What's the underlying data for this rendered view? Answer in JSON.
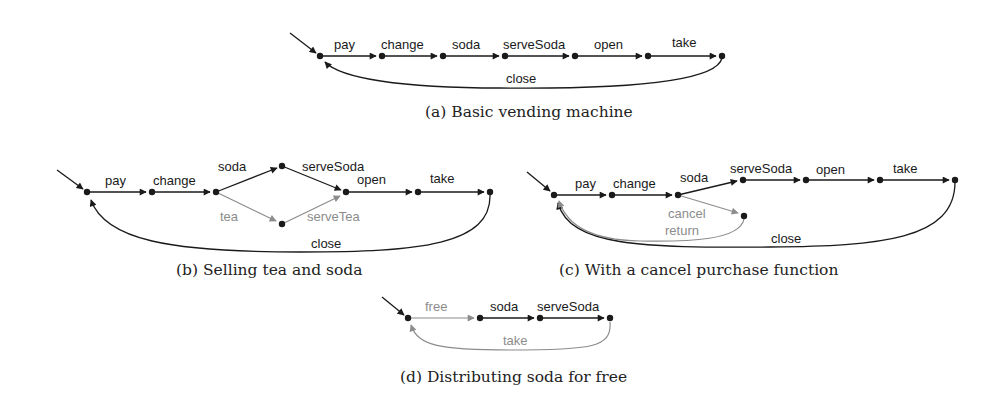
{
  "colors": {
    "black": "#1a1a1a",
    "gray": "#8c8c8c"
  },
  "figures": {
    "a": {
      "caption": "(a) Basic vending machine",
      "nodes": [
        [
          320,
          56
        ],
        [
          382,
          56
        ],
        [
          443,
          56
        ],
        [
          505,
          56
        ],
        [
          575,
          56
        ],
        [
          648,
          56
        ],
        [
          722,
          56
        ]
      ],
      "edges": [
        {
          "label": "pay",
          "lx": 347,
          "ly": 49
        },
        {
          "label": "change",
          "lx": 404,
          "ly": 49
        },
        {
          "label": "soda",
          "lx": 469,
          "ly": 49
        },
        {
          "label": "serveSoda",
          "lx": 532,
          "ly": 49
        },
        {
          "label": "open",
          "lx": 608,
          "ly": 49
        },
        {
          "label": "take",
          "lx": 684,
          "ly": 47
        },
        {
          "label": "close",
          "lx": 520,
          "ly": 86
        }
      ]
    },
    "b": {
      "caption": "(b) Selling tea and soda",
      "nodes": [
        [
          87,
          192
        ],
        [
          152,
          192
        ],
        [
          216,
          192
        ],
        [
          282,
          166
        ],
        [
          346,
          192
        ],
        [
          418,
          192
        ],
        [
          490,
          192
        ],
        [
          282,
          224
        ]
      ],
      "edges": [
        {
          "label": "pay",
          "lx": 118,
          "ly": 185
        },
        {
          "label": "change",
          "lx": 175,
          "ly": 185
        },
        {
          "label": "soda",
          "lx": 234,
          "ly": 171
        },
        {
          "label": "serveSoda",
          "lx": 325,
          "ly": 171
        },
        {
          "label": "open",
          "lx": 381,
          "ly": 184
        },
        {
          "label": "take",
          "lx": 452,
          "ly": 183
        },
        {
          "label": "tea",
          "lx": 229,
          "ly": 221
        },
        {
          "label": "serveTea",
          "lx": 328,
          "ly": 221
        },
        {
          "label": "close",
          "lx": 325,
          "ly": 248
        }
      ]
    },
    "c": {
      "caption": "(c) With a cancel purchase function",
      "nodes": [
        [
          554,
          195
        ],
        [
          612,
          195
        ],
        [
          678,
          195
        ],
        [
          743,
          180
        ],
        [
          806,
          180
        ],
        [
          880,
          180
        ],
        [
          955,
          180
        ],
        [
          744,
          216
        ]
      ],
      "edges": [
        {
          "label": "pay",
          "lx": 589,
          "ly": 187
        },
        {
          "label": "change",
          "lx": 640,
          "ly": 188
        },
        {
          "label": "soda",
          "lx": 696,
          "ly": 182
        },
        {
          "label": "serveSoda",
          "lx": 770,
          "ly": 173
        },
        {
          "label": "open",
          "lx": 830,
          "ly": 174
        },
        {
          "label": "take",
          "lx": 907,
          "ly": 173
        },
        {
          "label": "cancel",
          "lx": 689,
          "ly": 218
        },
        {
          "label": "return",
          "lx": 684,
          "ly": 235
        },
        {
          "label": "close",
          "lx": 786,
          "ly": 243
        }
      ]
    },
    "d": {
      "caption": "(d) Distributing soda for free",
      "nodes": [
        [
          408,
          318
        ],
        [
          480,
          318
        ],
        [
          540,
          318
        ],
        [
          610,
          318
        ]
      ],
      "edges": [
        {
          "label": "free",
          "lx": 440,
          "ly": 311
        },
        {
          "label": "soda",
          "lx": 505,
          "ly": 311
        },
        {
          "label": "serveSoda",
          "lx": 564,
          "ly": 311
        },
        {
          "label": "take",
          "lx": 516,
          "ly": 345
        }
      ]
    }
  }
}
